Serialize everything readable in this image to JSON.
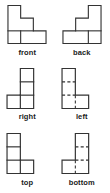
{
  "figure": {
    "type": "technical-drawing",
    "grid": {
      "columns": 2,
      "rows": 3
    },
    "stroke_color": "#333333",
    "hidden_stroke_color": "#333333",
    "background_color": "#ffffff",
    "unit_cell_px": 13,
    "views": [
      {
        "id": "front",
        "label": "front",
        "description": "Descending staircase outline with a small square notch at the lower left",
        "outline": "0,0 13,0 13,13 26,13 26,26 39,26 39,39 0,39",
        "solid_lines": [
          "0,26 26,26",
          "13,26 13,39"
        ],
        "hidden_lines": []
      },
      {
        "id": "back",
        "label": "back",
        "description": "Mirror of the front view; ascending staircase with a small square notch at the lower right",
        "outline": "39,0 26,0 26,13 13,13 13,26 0,26 0,39 39,39",
        "solid_lines": [
          "39,26 13,26",
          "26,26 26,39"
        ],
        "hidden_lines": []
      },
      {
        "id": "right",
        "label": "right",
        "description": "Vertical stack of three squares on the right with one square attached at the lower left",
        "outline": "13,0 26,0 26,39 0,39 0,26 13,26",
        "solid_lines": [
          "13,13 26,13",
          "13,26 26,26",
          "13,26 13,39"
        ],
        "hidden_lines": []
      },
      {
        "id": "left",
        "label": "left",
        "description": "Mirror of the right view; vertical stack of three squares on the left with one square at the lower right, internal edges shown as hidden dashed lines",
        "outline": "13,0 0,0 0,39 26,39 26,26 13,26",
        "solid_lines": [],
        "hidden_lines": [
          "0,13 13,13",
          "0,26 13,26",
          "13,26 13,39"
        ]
      },
      {
        "id": "top",
        "label": "top",
        "description": "Vertical stack of three squares on the left with one square attached at the lower right",
        "outline": "0,0 13,0 13,26 26,26 26,39 0,39",
        "solid_lines": [
          "0,13 13,13",
          "0,26 13,26",
          "13,26 13,39"
        ],
        "hidden_lines": []
      },
      {
        "id": "bottom",
        "label": "bottom",
        "description": "Vertical stack of three squares on the right with one square at the lower left, internal edges shown as hidden dashed lines",
        "outline": "26,0 13,0 13,26 0,26 0,39 26,39",
        "solid_lines": [],
        "hidden_lines": [
          "13,13 26,13",
          "13,26 26,26",
          "13,26 13,39"
        ]
      }
    ]
  }
}
